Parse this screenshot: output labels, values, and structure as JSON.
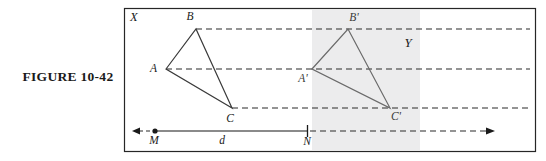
{
  "figure": {
    "caption": "FIGURE 10-42"
  },
  "diagram": {
    "frame_label": "X",
    "region_label": "Y",
    "region_fill": "#ececed",
    "frame_stroke": "#262626",
    "line_stroke": "#3a3a3a",
    "axis_stroke": "#8a8a8a",
    "vertices": [
      {
        "id": "A",
        "label": "A",
        "x": 166,
        "y": 69,
        "label_x": 157,
        "label_y": 72
      },
      {
        "id": "B",
        "label": "B",
        "x": 196,
        "y": 29,
        "label_x": 190,
        "label_y": 19
      },
      {
        "id": "C",
        "label": "C",
        "x": 232,
        "y": 108,
        "label_x": 228,
        "label_y": 122
      },
      {
        "id": "Aprime",
        "label": "A'",
        "x": 312,
        "y": 69,
        "label_x": 303,
        "label_y": 81
      },
      {
        "id": "Bprime",
        "label": "B'",
        "x": 348,
        "y": 29,
        "label_x": 352,
        "label_y": 20
      },
      {
        "id": "Cprime",
        "label": "C'",
        "x": 390,
        "y": 108,
        "label_x": 394,
        "label_y": 120
      }
    ],
    "axis": {
      "y": 131,
      "left_arrow_x": 133,
      "right_arrow_x": 494,
      "M_label": "M",
      "M_x": 155,
      "N_label": "N",
      "N_x": 307,
      "distance_label": "d",
      "distance_x": 222,
      "label_y": 144
    }
  }
}
